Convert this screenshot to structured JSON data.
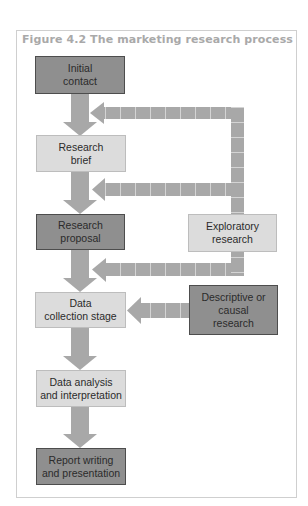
{
  "figure": {
    "title": "Figure 4.2 The marketing research process"
  },
  "colors": {
    "dark_box_fill": "#8f8f8f",
    "dark_box_border": "#4d4d4d",
    "light_box_fill": "#dcdcdc",
    "light_box_border": "#bdbdbd",
    "arrow": "#a8a8a8",
    "arrow_segment_line": "#d4d4d4",
    "title_text": "#a9a9a9"
  },
  "main_flow": [
    {
      "id": "initial-contact",
      "label": "Initial\ncontact",
      "style": "dark"
    },
    {
      "id": "research-brief",
      "label": "Research\nbrief",
      "style": "light"
    },
    {
      "id": "research-proposal",
      "label": "Research\nproposal",
      "style": "dark"
    },
    {
      "id": "data-collection",
      "label": "Data\ncollection stage",
      "style": "light"
    },
    {
      "id": "data-analysis",
      "label": "Data analysis\nand interpretation",
      "style": "light"
    },
    {
      "id": "report-writing",
      "label": "Report writing\nand presentation",
      "style": "dark"
    }
  ],
  "side_boxes": [
    {
      "id": "exploratory-research",
      "label": "Exploratory\nresearch",
      "style": "light"
    },
    {
      "id": "descriptive-causal-research",
      "label": "Descriptive or\ncausal\nresearch",
      "style": "dark"
    }
  ],
  "connections": [
    {
      "from": "Initial contact",
      "to": "Research brief",
      "type": "solid"
    },
    {
      "from": "Research brief",
      "to": "Research proposal",
      "type": "solid"
    },
    {
      "from": "Research proposal",
      "to": "Data collection stage",
      "type": "solid"
    },
    {
      "from": "Data collection stage",
      "to": "Data analysis and interpretation",
      "type": "solid"
    },
    {
      "from": "Data analysis and interpretation",
      "to": "Report writing and presentation",
      "type": "solid"
    },
    {
      "from": "Exploratory research",
      "to": "Initial contact → Research brief",
      "type": "feedback"
    },
    {
      "from": "Exploratory research",
      "to": "Research brief → Research proposal",
      "type": "feedback"
    },
    {
      "from": "Exploratory research",
      "to": "Research proposal → Data collection stage",
      "type": "feedback"
    },
    {
      "from": "Descriptive or causal research",
      "to": "Data collection stage",
      "type": "feedback"
    }
  ]
}
